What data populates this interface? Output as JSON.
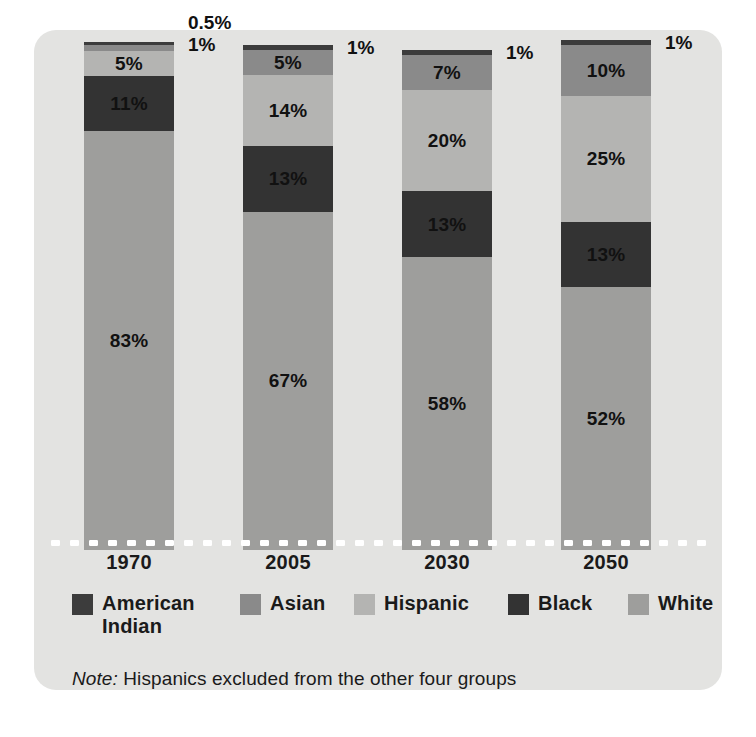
{
  "card": {
    "background": "#e3e3e1"
  },
  "chart_data": {
    "type": "bar",
    "subtype": "100% stacked bar",
    "title": "",
    "subtitle": "",
    "xlabel": "",
    "ylabel": "",
    "ylim": [
      0,
      100
    ],
    "grid": false,
    "legend_position": "bottom",
    "categories": [
      "1970",
      "2005",
      "2030",
      "2050"
    ],
    "series": [
      {
        "name": "American Indian",
        "color": "#3c3c3c",
        "values": [
          0.5,
          1,
          1,
          1
        ],
        "labels": [
          "0.5%",
          "1%",
          "1%",
          "1%"
        ],
        "label_placement": "outside"
      },
      {
        "name": "Asian",
        "color": "#8a8a8a",
        "values": [
          1,
          5,
          7,
          10
        ],
        "labels": [
          "1%",
          "5%",
          "7%",
          "10%"
        ],
        "label_placement": "mixed"
      },
      {
        "name": "Hispanic",
        "color": "#b4b4b2",
        "values": [
          5,
          14,
          20,
          25
        ],
        "labels": [
          "5%",
          "14%",
          "20%",
          "25%"
        ],
        "label_placement": "inside"
      },
      {
        "name": "Black",
        "color": "#333333",
        "values": [
          11,
          13,
          13,
          13
        ],
        "labels": [
          "11%",
          "13%",
          "13%",
          "13%"
        ],
        "label_placement": "inside"
      },
      {
        "name": "White",
        "color": "#9e9e9c",
        "values": [
          83,
          67,
          58,
          52
        ],
        "labels": [
          "83%",
          "67%",
          "58%",
          "52%"
        ],
        "label_placement": "inside"
      }
    ],
    "note": "Note: Hispanics excluded from the other four groups"
  },
  "bars": [
    {
      "year": "1970",
      "total_height_pct": 93,
      "outside_labels": [
        "0.5%",
        "1%"
      ],
      "segments": [
        {
          "series": "American Indian",
          "label": "",
          "pct": 0.5,
          "color": "#3c3c3c"
        },
        {
          "series": "Asian",
          "label": "",
          "pct": 1,
          "color": "#8a8a8a"
        },
        {
          "series": "Hispanic",
          "label": "5%",
          "pct": 5,
          "color": "#b4b4b2"
        },
        {
          "series": "Black",
          "label": "11%",
          "pct": 11,
          "color": "#333333"
        },
        {
          "series": "White",
          "label": "83%",
          "pct": 83,
          "color": "#9e9e9c"
        }
      ]
    },
    {
      "year": "2005",
      "total_height_pct": 90,
      "outside_labels": [
        "1%"
      ],
      "segments": [
        {
          "series": "American Indian",
          "label": "",
          "pct": 1,
          "color": "#3c3c3c"
        },
        {
          "series": "Asian",
          "label": "5%",
          "pct": 5,
          "color": "#8a8a8a"
        },
        {
          "series": "Hispanic",
          "label": "14%",
          "pct": 14,
          "color": "#b4b4b2"
        },
        {
          "series": "Black",
          "label": "13%",
          "pct": 13,
          "color": "#333333"
        },
        {
          "series": "White",
          "label": "67%",
          "pct": 67,
          "color": "#9e9e9c"
        }
      ]
    },
    {
      "year": "2030",
      "total_height_pct": 90,
      "outside_labels": [
        "1%"
      ],
      "segments": [
        {
          "series": "American Indian",
          "label": "",
          "pct": 1,
          "color": "#3c3c3c"
        },
        {
          "series": "Asian",
          "label": "7%",
          "pct": 7,
          "color": "#8a8a8a"
        },
        {
          "series": "Hispanic",
          "label": "20%",
          "pct": 20,
          "color": "#b4b4b2"
        },
        {
          "series": "Black",
          "label": "13%",
          "pct": 13,
          "color": "#333333"
        },
        {
          "series": "White",
          "label": "58%",
          "pct": 58,
          "color": "#9e9e9c"
        }
      ]
    },
    {
      "year": "2050",
      "total_height_pct": 92,
      "outside_labels": [
        "1%"
      ],
      "segments": [
        {
          "series": "American Indian",
          "label": "",
          "pct": 1,
          "color": "#3c3c3c"
        },
        {
          "series": "Asian",
          "label": "10%",
          "pct": 10,
          "color": "#8a8a8a"
        },
        {
          "series": "Hispanic",
          "label": "25%",
          "pct": 25,
          "color": "#b4b4b2"
        },
        {
          "series": "Black",
          "label": "13%",
          "pct": 13,
          "color": "#333333"
        },
        {
          "series": "White",
          "label": "52%",
          "pct": 52,
          "color": "#9e9e9c"
        }
      ]
    }
  ],
  "xaxis": {
    "ticks": [
      "1970",
      "2005",
      "2030",
      "2050"
    ]
  },
  "legend": {
    "items": [
      {
        "label": "American\nIndian",
        "color": "#3c3c3c"
      },
      {
        "label": "Asian",
        "color": "#8a8a8a"
      },
      {
        "label": "Hispanic",
        "color": "#b4b4b2"
      },
      {
        "label": "Black",
        "color": "#333333"
      },
      {
        "label": "White",
        "color": "#9e9e9c"
      }
    ]
  },
  "note": {
    "prefix": "Note:",
    "text": " Hispanics excluded from the other four groups"
  }
}
